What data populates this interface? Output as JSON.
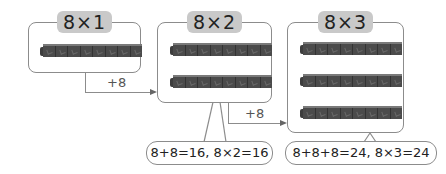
{
  "panels": [
    {
      "label": "8×1",
      "bars": 1
    },
    {
      "label": "8×2",
      "bars": 2
    },
    {
      "label": "8×3",
      "bars": 3
    }
  ],
  "connectors": [
    {
      "label": "+8"
    },
    {
      "label": "+8"
    }
  ],
  "bubbles": [
    {
      "text": "8+8=16, 8×2=16"
    },
    {
      "text": "8+8+8=24, 8×3=24"
    }
  ],
  "colors": {
    "block": "#4b4b4b",
    "pill": "#c9c9c9",
    "border": "#8c8c8c"
  }
}
